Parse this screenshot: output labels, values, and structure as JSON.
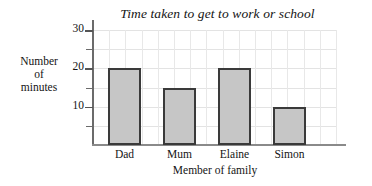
{
  "chart_data": {
    "type": "bar",
    "title": "Time taken to get to work or school",
    "xlabel": "Member of family",
    "ylabel_lines": [
      "Number",
      "of",
      "minutes"
    ],
    "ylabel": "Number of minutes",
    "categories": [
      "Dad",
      "Mum",
      "Elaine",
      "Simon"
    ],
    "values": [
      20,
      15,
      20,
      10
    ],
    "ylim": [
      0,
      30
    ],
    "ytick_labels": [
      "10",
      "20",
      "30"
    ],
    "ytick_values": [
      10,
      20,
      30
    ],
    "minor_tick_values": [
      5,
      15,
      25
    ],
    "grid": true,
    "legend": "none",
    "colors": {
      "bar_fill": "#c6c6c6",
      "bar_border": "#3a3a3a",
      "gridline": "#e3e3e3",
      "axis": "#6b6b6b",
      "text": "#141414"
    }
  }
}
